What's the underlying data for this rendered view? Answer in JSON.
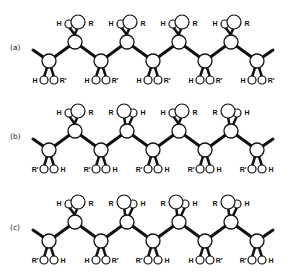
{
  "figure": {
    "colors": {
      "bond": "#111111",
      "atom_fill": "#ffffff",
      "atom_stroke": "#111111"
    }
  },
  "rows": [
    {
      "label": "(a)",
      "top": [
        {
          "left": "H",
          "right": "R"
        },
        {
          "left": "H",
          "right": "R"
        },
        {
          "left": "H",
          "right": "R"
        },
        {
          "left": "H",
          "right": "R"
        }
      ],
      "bottom": [
        {
          "left": "H",
          "right": "R′"
        },
        {
          "left": "H",
          "right": "R′"
        },
        {
          "left": "H",
          "right": "R′"
        },
        {
          "left": "H",
          "right": "R′"
        },
        {
          "left": "H",
          "right": "R′"
        }
      ]
    },
    {
      "label": "(b)",
      "top": [
        {
          "left": "H",
          "right": "R"
        },
        {
          "left": "R",
          "right": "H"
        },
        {
          "left": "H",
          "right": "R"
        },
        {
          "left": "R",
          "right": "H"
        }
      ],
      "bottom": [
        {
          "left": "R′",
          "right": "H"
        },
        {
          "left": "R′",
          "right": "H"
        },
        {
          "left": "R′",
          "right": "H"
        },
        {
          "left": "R′",
          "right": "H"
        },
        {
          "left": "R′",
          "right": "H"
        }
      ]
    },
    {
      "label": "(c)",
      "top": [
        {
          "left": "H",
          "right": "R"
        },
        {
          "left": "R",
          "right": "H"
        },
        {
          "left": "R",
          "right": "H"
        },
        {
          "left": "R",
          "right": "H"
        }
      ],
      "bottom": [
        {
          "left": "R′",
          "right": "H"
        },
        {
          "left": "H",
          "right": "R′"
        },
        {
          "left": "R′",
          "right": "H"
        },
        {
          "left": "H",
          "right": "R′"
        },
        {
          "left": "R′",
          "right": "H"
        }
      ]
    }
  ]
}
